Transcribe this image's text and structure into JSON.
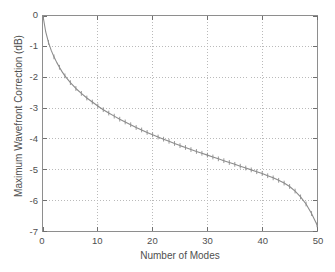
{
  "chart_data": {
    "type": "line",
    "title": "",
    "xlabel": "Number of Modes",
    "ylabel": "Maximum Wavefront Correction (dB)",
    "xlim": [
      0,
      50
    ],
    "ylim": [
      -7,
      0
    ],
    "xticks": [
      0,
      10,
      20,
      30,
      40,
      50
    ],
    "yticks": [
      0,
      -1,
      -2,
      -3,
      -4,
      -5,
      -6,
      -7
    ],
    "xtick_labels": [
      "0",
      "10",
      "20",
      "30",
      "40",
      "50"
    ],
    "ytick_labels": [
      "0",
      "-1",
      "-2",
      "-3",
      "-4",
      "-5",
      "-6",
      "-7"
    ],
    "grid": true,
    "grid_style": "dotted",
    "legend": null,
    "line_color": "#8c8c8c",
    "marker": "tick-cross",
    "marker_color": "#8c8c8c",
    "series": [
      {
        "name": "Maximum Wavefront Correction",
        "x": [
          0,
          1,
          2,
          3,
          4,
          5,
          6,
          7,
          8,
          9,
          10,
          11,
          12,
          13,
          14,
          15,
          16,
          17,
          18,
          19,
          20,
          21,
          22,
          23,
          24,
          25,
          26,
          27,
          28,
          29,
          30,
          31,
          32,
          33,
          34,
          35,
          36,
          37,
          38,
          39,
          40,
          41,
          42,
          43,
          44,
          45,
          46,
          47,
          48,
          49,
          50
        ],
        "values": [
          0.0,
          -0.72,
          -1.12,
          -1.45,
          -1.72,
          -1.96,
          -2.17,
          -2.36,
          -2.53,
          -2.69,
          -2.99,
          -3.06,
          -3.18,
          -3.3,
          -3.41,
          -3.52,
          -3.62,
          -3.98,
          -3.95,
          -4.04,
          -4.13,
          -4.21,
          -4.29,
          -4.37,
          -4.44,
          -4.83,
          -4.72,
          -4.79,
          -4.86,
          -4.92,
          -4.99,
          -5.05,
          -5.11,
          -5.17,
          -5.22,
          -5.28,
          -5.33,
          -5.39,
          -5.44,
          -5.49,
          -6.0,
          -5.68,
          -5.73,
          -5.78,
          -5.83,
          -5.87,
          -5.92,
          -5.96,
          -6.0,
          -6.05,
          -6.8
        ]
      }
    ],
    "curve_points": {
      "x": [
        0,
        0.5,
        1,
        1.5,
        2,
        2.5,
        3,
        3.5,
        4,
        5,
        6,
        7,
        8,
        9,
        10,
        11,
        12,
        13,
        14,
        15,
        16,
        17,
        18,
        19,
        20,
        21,
        22,
        23,
        24,
        25,
        26,
        27,
        28,
        29,
        30,
        31,
        32,
        33,
        34,
        35,
        36,
        37,
        38,
        39,
        40,
        41,
        42,
        43,
        44,
        45,
        46,
        47,
        48,
        49,
        50
      ],
      "y": [
        0.0,
        -0.52,
        -0.86,
        -1.12,
        -1.33,
        -1.51,
        -1.67,
        -1.82,
        -1.95,
        -2.17,
        -2.36,
        -2.52,
        -2.67,
        -2.8,
        -2.93,
        -3.05,
        -3.16,
        -3.26,
        -3.36,
        -3.45,
        -3.54,
        -3.63,
        -3.71,
        -3.79,
        -3.87,
        -3.94,
        -4.01,
        -4.08,
        -4.15,
        -4.22,
        -4.28,
        -4.35,
        -4.41,
        -4.47,
        -4.53,
        -4.59,
        -4.65,
        -4.71,
        -4.77,
        -4.83,
        -4.89,
        -4.95,
        -5.01,
        -5.07,
        -5.13,
        -5.2,
        -5.27,
        -5.35,
        -5.44,
        -5.55,
        -5.7,
        -5.89,
        -6.12,
        -6.43,
        -6.8
      ]
    },
    "markers_x": [
      1,
      2,
      3,
      4,
      5,
      6,
      7,
      8,
      9,
      10,
      11,
      12,
      13,
      14,
      15,
      16,
      17,
      18,
      19,
      20,
      21,
      22,
      23,
      24,
      25,
      26,
      27,
      28,
      29,
      30,
      31,
      32,
      33,
      34,
      35,
      36,
      37,
      38,
      39,
      40,
      41,
      42,
      43,
      44,
      45,
      46,
      47,
      48,
      49,
      50
    ]
  },
  "axes": {
    "x_title": "Number of Modes",
    "y_title": "Maximum Wavefront Correction (dB)"
  }
}
